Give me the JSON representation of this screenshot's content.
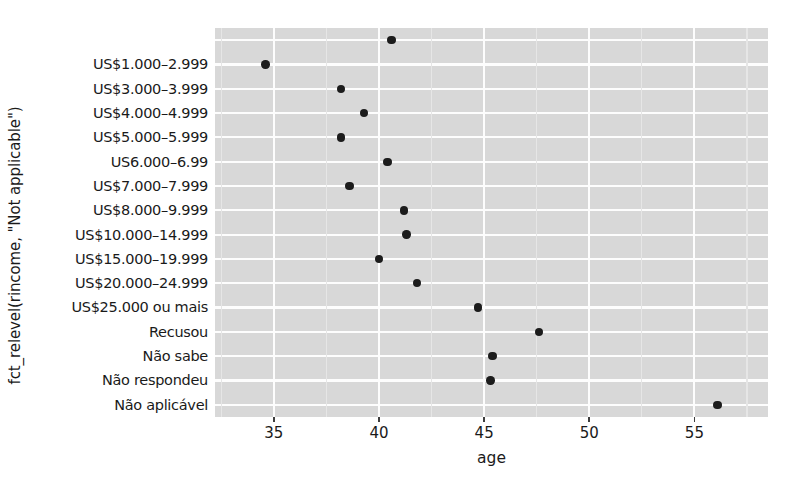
{
  "chart_data": {
    "type": "scatter",
    "title": "",
    "xlabel": "age",
    "ylabel": "fct_relevel(rincome, \"Not applicable\")",
    "xlim": [
      32.2,
      58.5
    ],
    "grid": true,
    "legend": "none",
    "x_ticks": [
      35,
      40,
      45,
      50,
      55
    ],
    "x_tick_labels": [
      "35",
      "40",
      "45",
      "50",
      "55"
    ],
    "categories": [
      "",
      "US$1.000–2.999",
      "US$3.000–3.999",
      "US$4.000–4.999",
      "US$5.000–5.999",
      "US6.000–6.99",
      "US$7.000–7.999",
      "US$8.000–9.999",
      "US$10.000–14.999",
      "US$15.000–19.999",
      "US$20.000–24.999",
      "US$25.000 ou mais",
      "Recusou",
      "Não sabe",
      "Não respondeu",
      "Não aplicável"
    ],
    "values": [
      40.6,
      34.6,
      38.2,
      39.3,
      38.2,
      40.4,
      38.6,
      41.2,
      41.3,
      40.0,
      41.8,
      44.7,
      47.6,
      45.4,
      45.3,
      56.1
    ],
    "colors": {
      "panel_background": "#d8d8d8",
      "gridline_major": "#fdfdfd",
      "gridline_minor": "#e6e6e6",
      "point": "#1c1c1c",
      "text": "#1a1a1a",
      "figure_background": "#ffffff"
    }
  }
}
